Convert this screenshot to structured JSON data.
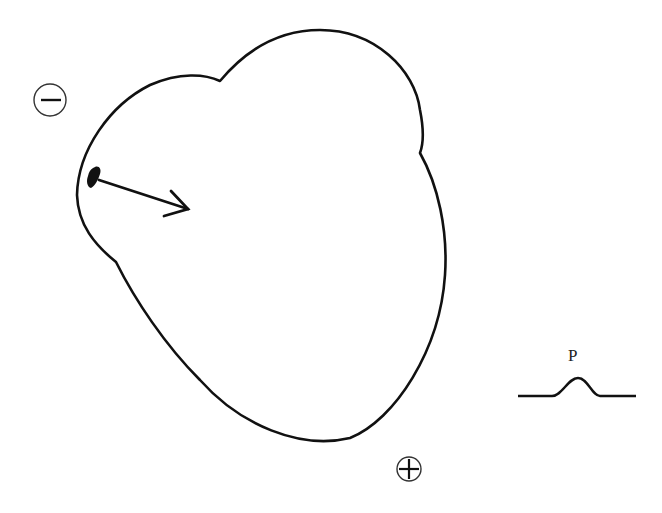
{
  "diagram": {
    "negative_electrode": {
      "symbol": "−",
      "icon": "minus-circle-icon"
    },
    "positive_electrode": {
      "symbol": "+",
      "icon": "plus-circle-icon"
    },
    "origin": {
      "icon": "sinoatrial-node-blob"
    },
    "vector": {
      "icon": "arrow-right-down-icon"
    },
    "waveform": {
      "label": "P",
      "icon": "p-wave-trace"
    },
    "colors": {
      "stroke": "#111111",
      "background": "#ffffff"
    }
  }
}
